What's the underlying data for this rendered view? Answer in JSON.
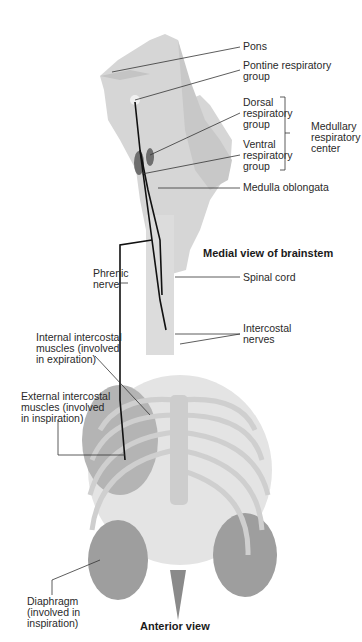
{
  "diagram": {
    "views": {
      "brainstem_view": "Medial view of brainstem",
      "thorax_view": "Anterior view"
    },
    "labels": {
      "pons": "Pons",
      "pontine_group": "Pontine respiratory\ngroup",
      "dorsal_group": "Dorsal\nrespiratory\ngroup",
      "ventral_group": "Ventral\nrespiratory\ngroup",
      "medullary_center": "Medullary\nrespiratory\ncenter",
      "medulla": "Medulla oblongata",
      "phrenic": "Phrenic\nnerve",
      "spinal_cord": "Spinal cord",
      "intercostal_nerves": "Intercostal\nnerves",
      "internal_intercostal": "Internal intercostal\nmuscles (involved\nin expiration)",
      "external_intercostal": "External intercostal\nmuscles (involved\nin inspiration)",
      "diaphragm": "Diaphragm\n(involved in\ninspiration)"
    },
    "colors": {
      "tissue": "#d4d4d4",
      "tissue_dark": "#bdbdbd",
      "bone": "#e2e2e2",
      "nucleus": "#6e6e6e",
      "nerve": "#111111",
      "leader": "#333333",
      "muscle": "#9a9a9a"
    }
  }
}
